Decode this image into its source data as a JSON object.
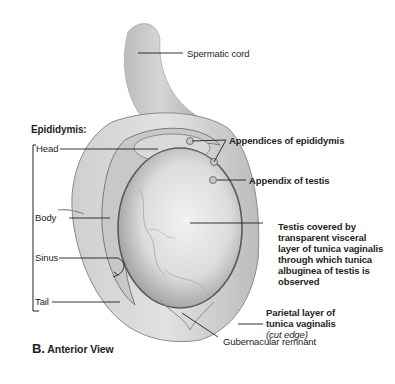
{
  "figure": {
    "letter": "B.",
    "view": "Anterior View"
  },
  "labels": {
    "spermatic_cord": "Spermatic cord",
    "epididymis_heading": "Epididymis:",
    "head": "Head",
    "body": "Body",
    "sinus": "Sinus",
    "tail": "Tail",
    "appendices_epididymis": "Appendices of epididymis",
    "appendix_testis": "Appendix of testis",
    "testis_covered": [
      "Testis covered by",
      "transparent visceral",
      "layer of tunica vaginalis",
      "through which tunica",
      "albuginea of testis is",
      "observed"
    ],
    "parietal_layer": [
      "Parietal layer of",
      "tunica vaginalis"
    ],
    "cut_edge": "cut edge",
    "gubernacular_remnant": "Gubernacular remnant"
  },
  "colors": {
    "leader": "#231f20",
    "tissue_light": "#e6e6e6",
    "tissue_mid": "#bdbdbd",
    "tissue_dark": "#6f6f6f"
  }
}
